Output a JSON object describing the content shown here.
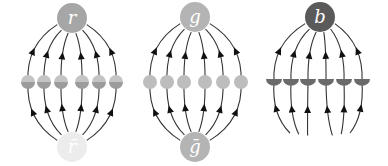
{
  "diagrams": [
    {
      "id": "red",
      "top_node": {
        "label": "r",
        "cx": 72,
        "cy": 18,
        "r": 15,
        "fill": "#a6a6a6",
        "label_color": "#ffffff"
      },
      "bottom_node": {
        "label": "r̄",
        "cx": 72,
        "cy": 147,
        "r": 15,
        "fill": "#ececec",
        "label_color": "#f8f8f8"
      },
      "mid_y": 82,
      "mid_marker_style": "split",
      "mid_marker_colors": {
        "top": "#c4c4c4",
        "bottom": "#9c9c9c"
      },
      "mid_x": [
        28,
        44,
        61,
        82,
        99,
        116
      ],
      "bottom_open": false
    },
    {
      "id": "green",
      "top_node": {
        "label": "g",
        "cx": 195,
        "cy": 17,
        "r": 15,
        "fill": "#b4b4b4",
        "label_color": "#ffffff"
      },
      "bottom_node": {
        "label": "ḡ",
        "cx": 195,
        "cy": 147,
        "r": 15,
        "fill": "#b4b4b4",
        "label_color": "#ffffff"
      },
      "mid_y": 82,
      "mid_marker_style": "full",
      "mid_marker_colors": {
        "top": "#bdbdbd",
        "bottom": "#bdbdbd"
      },
      "mid_x": [
        150,
        167,
        184,
        205,
        223,
        241
      ],
      "bottom_open": false
    },
    {
      "id": "blue",
      "top_node": {
        "label": "b",
        "cx": 320,
        "cy": 17,
        "r": 15,
        "fill": "#5a5a5a",
        "label_color": "#ffffff"
      },
      "bottom_node": null,
      "mid_y": 82,
      "mid_marker_style": "lower-half",
      "mid_marker_colors": {
        "top": "none",
        "bottom": "#6a6a6a"
      },
      "mid_x": [
        274,
        291,
        308,
        326,
        344,
        362
      ],
      "bottom_open": true
    }
  ],
  "colors": {
    "line": "#333333",
    "arrow": "#111111",
    "background": "#ffffff"
  }
}
